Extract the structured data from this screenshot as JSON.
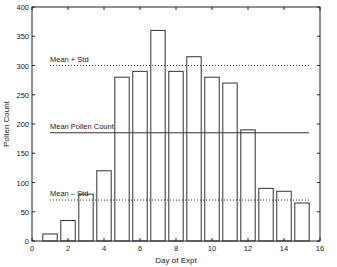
{
  "chart_data": {
    "type": "bar",
    "title": "",
    "xlabel": "Day of Expt",
    "ylabel": "Pollen Count",
    "xlim": [
      0,
      16
    ],
    "ylim": [
      0,
      400
    ],
    "xticks": [
      0,
      2,
      4,
      6,
      8,
      10,
      12,
      14,
      16
    ],
    "yticks": [
      0,
      50,
      100,
      150,
      200,
      250,
      300,
      350,
      400
    ],
    "categories": [
      1,
      2,
      3,
      4,
      5,
      6,
      7,
      8,
      9,
      10,
      11,
      12,
      13,
      14,
      15
    ],
    "values": [
      12,
      35,
      80,
      120,
      280,
      290,
      360,
      290,
      315,
      280,
      270,
      190,
      90,
      85,
      65
    ],
    "grid": false,
    "reference_lines": [
      {
        "label": "Mean + Std",
        "value": 300,
        "style": "dotted"
      },
      {
        "label": "Mean Pollen Count",
        "value": 185,
        "style": "solid"
      },
      {
        "label": "Mean – Std",
        "value": 70,
        "style": "dotted"
      }
    ]
  },
  "colors": {
    "axis": "#222222",
    "bar_edge": "#333333",
    "bar_fill": "#ffffff"
  }
}
